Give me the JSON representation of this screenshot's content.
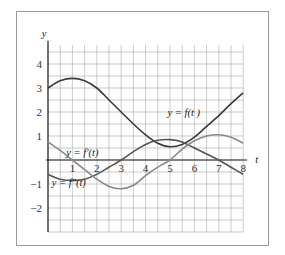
{
  "chart_data": {
    "type": "line",
    "title": "",
    "xlabel": "t",
    "ylabel": "y",
    "xlim": [
      0,
      8
    ],
    "ylim": [
      -3,
      5
    ],
    "grid": true,
    "grid_step": 0.5,
    "x_ticks": [
      "1",
      "2",
      "3",
      "4",
      "5",
      "6",
      "7",
      "8"
    ],
    "y_ticks": [
      "4",
      "3",
      "2",
      "1",
      "−1",
      "−2"
    ],
    "x_tick_values": [
      1,
      2,
      3,
      4,
      5,
      6,
      7,
      8
    ],
    "y_tick_values": [
      4,
      3,
      2,
      1,
      -1,
      -2
    ],
    "series": [
      {
        "name": "y = f(t)",
        "color": "#3a3a3a",
        "x": [
          0,
          0.5,
          1,
          1.5,
          2,
          2.5,
          3,
          3.5,
          4,
          4.5,
          5,
          5.5,
          6,
          6.5,
          7,
          7.5,
          8
        ],
        "values": [
          3.0,
          3.3,
          3.4,
          3.3,
          3.0,
          2.5,
          2.0,
          1.5,
          1.05,
          0.7,
          0.55,
          0.65,
          0.95,
          1.4,
          1.85,
          2.35,
          2.8
        ]
      },
      {
        "name": "y = f′(t)",
        "color": "#555555",
        "x": [
          0,
          0.5,
          1,
          1.5,
          2,
          2.5,
          3,
          3.5,
          4,
          4.5,
          5,
          5.5,
          6,
          6.5,
          7,
          7.5,
          8
        ],
        "values": [
          -0.6,
          -0.8,
          -0.85,
          -0.8,
          -0.6,
          -0.3,
          0.0,
          0.35,
          0.65,
          0.82,
          0.85,
          0.75,
          0.5,
          0.25,
          0.0,
          -0.3,
          -0.6
        ]
      },
      {
        "name": "y = f″(t)",
        "color": "#8a8a8a",
        "x": [
          0,
          0.5,
          1,
          1.5,
          2,
          2.5,
          3,
          3.5,
          4,
          4.5,
          5,
          5.5,
          6,
          6.5,
          7,
          7.5,
          8
        ],
        "values": [
          0.75,
          0.4,
          0.0,
          -0.4,
          -0.8,
          -1.1,
          -1.2,
          -1.05,
          -0.65,
          -0.3,
          0.0,
          0.45,
          0.8,
          1.0,
          1.05,
          0.95,
          0.7
        ]
      }
    ],
    "annotations": [
      {
        "text": "y = f(t )",
        "near_series": 0
      },
      {
        "text": "y = f′(t)",
        "near_series": 1
      },
      {
        "text": "y = f″(t)",
        "near_series": 2
      }
    ]
  }
}
